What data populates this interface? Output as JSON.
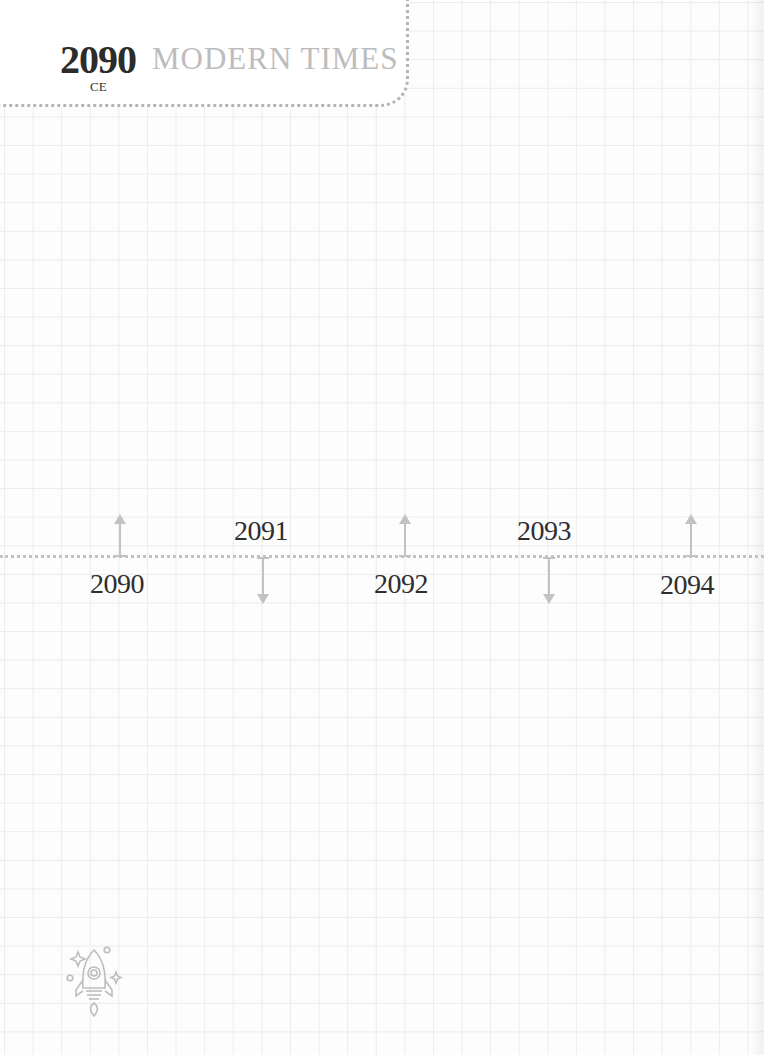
{
  "header": {
    "year": "2090",
    "era": "CE",
    "title": "MODERN TIMES"
  },
  "timeline": {
    "points": [
      {
        "year": "2090",
        "direction": "up",
        "label_position": "below"
      },
      {
        "year": "2091",
        "direction": "down",
        "label_position": "above"
      },
      {
        "year": "2092",
        "direction": "up",
        "label_position": "below"
      },
      {
        "year": "2093",
        "direction": "down",
        "label_position": "above"
      },
      {
        "year": "2094",
        "direction": "up",
        "label_position": "below"
      }
    ]
  },
  "decoration": {
    "icon": "rocket-icon"
  },
  "colors": {
    "grid": "#ececec",
    "title": "#bdbdbd",
    "text": "#2e2e2e",
    "arrow": "#c2c2c2",
    "dotted_border": "#b5b5b5"
  }
}
